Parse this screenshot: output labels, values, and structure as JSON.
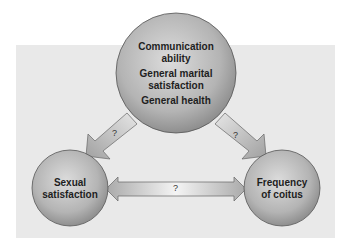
{
  "diagram": {
    "type": "causal-triangle",
    "nodes": {
      "top": {
        "lines": [
          "Communication",
          "ability",
          "General marital",
          "satisfaction",
          "General health"
        ],
        "items": [
          "Communication ability",
          "General marital satisfaction",
          "General health"
        ]
      },
      "left": {
        "lines": [
          "Sexual",
          "satisfaction"
        ]
      },
      "right": {
        "lines": [
          "Frequency",
          "of coitus"
        ]
      }
    },
    "edges": [
      {
        "from": "top",
        "to": "left",
        "label": "?",
        "direction": "one-way"
      },
      {
        "from": "top",
        "to": "right",
        "label": "?",
        "direction": "one-way"
      },
      {
        "from": "left",
        "to": "right",
        "label": "?",
        "direction": "two-way"
      }
    ],
    "colors": {
      "panel": "#e9e9e9",
      "circle_light": "#d8d8d8",
      "circle_dark": "#8f8f8f",
      "arrow_light": "#f4f4f4",
      "arrow_dark": "#a9a9a9",
      "outline": "#555555"
    }
  }
}
